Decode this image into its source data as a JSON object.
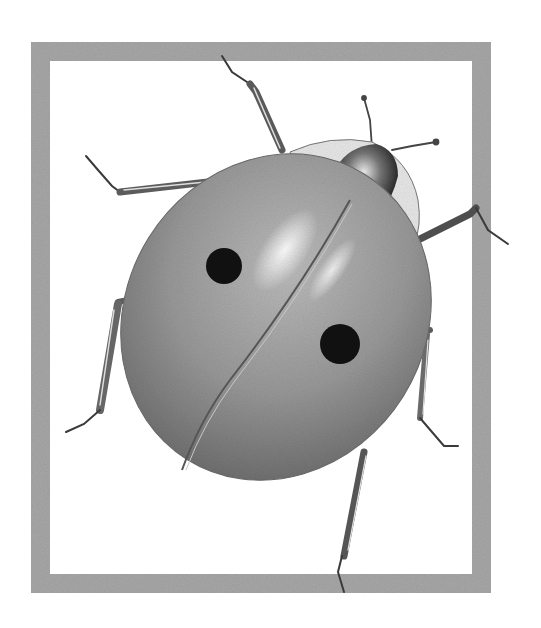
{
  "image": {
    "subject": "Pencil drawing of a two-spot ladybug inside a sketched frame",
    "style": "graphite pencil illustration",
    "width": 541,
    "height": 628
  },
  "frame": {
    "x": 31,
    "y": 42,
    "width": 460,
    "height": 551,
    "thickness": 19,
    "color": "#a9a9a9"
  },
  "ladybug": {
    "body_color": "#9a9a9a",
    "body_shadow": "#6e6e6e",
    "highlight_color": "#f4f4f4",
    "spot_color": "#111111",
    "spots": [
      {
        "cx": 224,
        "cy": 266,
        "r": 18
      },
      {
        "cx": 340,
        "cy": 344,
        "r": 20
      }
    ],
    "pronotum_color": "#e6e6e6",
    "head_color": "#2e2e2e",
    "leg_color": "#5a5a5a"
  }
}
